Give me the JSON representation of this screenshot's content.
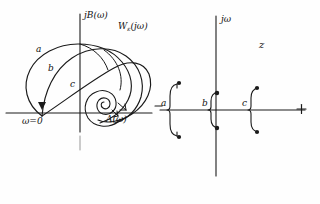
{
  "figure": {
    "ink_color": "#1a1a1a",
    "background": "#fefefe"
  },
  "left_plot": {
    "name": "nyquist-frequency-response-plot",
    "vertical_axis_label": "jB(ω)",
    "horizontal_axis_label": "A(ω)",
    "origin_label": "ω=0",
    "function_label_main": "W",
    "function_label_sub": "ε",
    "function_label_arg": "(jω)",
    "curve_labels": [
      "a",
      "b",
      "c"
    ],
    "curves": [
      {
        "id": "a",
        "label": "a",
        "description": "outer loop, largest excursion"
      },
      {
        "id": "b",
        "label": "b",
        "description": "middle loop"
      },
      {
        "id": "c",
        "label": "c",
        "description": "inner loop ending in spiral"
      }
    ],
    "spiral": {
      "name": "inward-spiral",
      "turns": 3
    }
  },
  "right_plot": {
    "name": "z-plane-pole-location-plot",
    "vertical_axis_label": "jω",
    "plane_label": "z",
    "positive_axis_marker": "+",
    "negative_axis_marker": "−",
    "pole_groups": [
      {
        "id": "a",
        "label": "a",
        "side": "left-half-plane",
        "poles": 2
      },
      {
        "id": "b",
        "label": "b",
        "side": "on-imaginary-axis",
        "poles": 2
      },
      {
        "id": "c",
        "label": "c",
        "side": "right-half-plane",
        "poles": 2
      }
    ]
  }
}
